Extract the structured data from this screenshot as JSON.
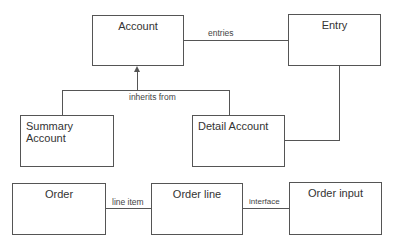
{
  "diagram": {
    "boxes": {
      "account": "Account",
      "entry": "Entry",
      "summary_account": "Summary Account",
      "detail_account": "Detail Account",
      "order": "Order",
      "order_line": "Order line",
      "order_input": "Order input"
    },
    "labels": {
      "entries": "entries",
      "inherits_from": "inherits from",
      "line_item": "line item",
      "interface": "interface"
    },
    "colors": {
      "line": "#555555",
      "text": "#333333",
      "background": "#ffffff"
    }
  }
}
